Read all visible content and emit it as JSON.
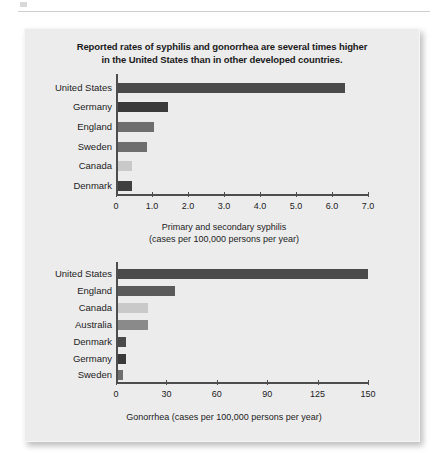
{
  "page": {
    "background_color": "#ffffff",
    "panel_color": "#ececed",
    "rule_color": "#cfcfcf"
  },
  "figure": {
    "title_line_1": "Reported rates of syphilis and gonorrhea are several times higher",
    "title_line_2": "in the United States than in other developed countries."
  },
  "palette": {
    "very_dark": "#3a3a3a",
    "dark": "#4a4a4a",
    "medium": "#6e6e6e",
    "light": "#c9c9c9",
    "axis": "#4d4d4d",
    "text": "#1c1c1c"
  },
  "chart_data": [
    {
      "id": "syphilis",
      "type": "bar",
      "orientation": "horizontal",
      "title": "",
      "xlabel": "Primary and secondary syphilis (cases per 100,000 persons per year)",
      "xlabel_line_1": "Primary and secondary syphilis",
      "xlabel_line_2": "(cases per 100,000 persons per year)",
      "ylabel": "",
      "categories": [
        "United States",
        "Germany",
        "England",
        "Sweden",
        "Canada",
        "Denmark"
      ],
      "values": [
        6.3,
        1.4,
        1.0,
        0.8,
        0.4,
        0.4
      ],
      "colors": [
        "#4a4a4a",
        "#3a3a3a",
        "#6e6e6e",
        "#6e6e6e",
        "#c9c9c9",
        "#3f3f3f"
      ],
      "xlim": [
        0,
        7.0
      ],
      "xticks": [
        0,
        1.0,
        2.0,
        3.0,
        4.0,
        5.0,
        6.0,
        7.0
      ],
      "xticklabels": [
        "0",
        "1.0",
        "2.0",
        "3.0",
        "4.0",
        "5.0",
        "6.0",
        "7.0"
      ],
      "grid": false,
      "legend": "none"
    },
    {
      "id": "gonorrhea",
      "type": "bar",
      "orientation": "horizontal",
      "title": "",
      "xlabel": "Gonorrhea (cases per 100,000 persons per year)",
      "xlabel_line_1": "Gonorrhea (cases per 100,000 persons per year)",
      "xlabel_line_2": "",
      "ylabel": "",
      "categories": [
        "United States",
        "England",
        "Canada",
        "Australia",
        "Denmark",
        "Germany",
        "Sweden"
      ],
      "values": [
        150,
        34,
        18,
        18,
        5,
        4.5,
        3
      ],
      "colors": [
        "#4a4a4a",
        "#5a5a5a",
        "#c9c9c9",
        "#8a8a8a",
        "#4a4a4a",
        "#3a3a3a",
        "#6e6e6e"
      ],
      "xlim": [
        0,
        150
      ],
      "xticks": [
        0,
        30,
        60,
        90,
        125,
        150
      ],
      "xticklabels": [
        "0",
        "30",
        "60",
        "90",
        "125",
        "150"
      ],
      "xtick_positions_pct": [
        0,
        20,
        40,
        60,
        80,
        100
      ],
      "grid": false,
      "legend": "none"
    }
  ]
}
